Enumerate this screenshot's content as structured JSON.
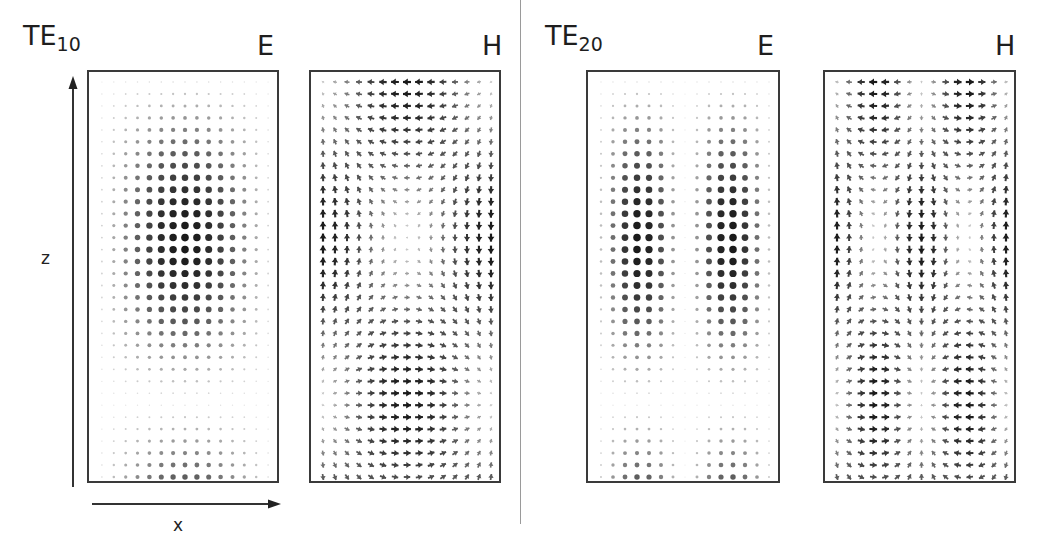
{
  "figure": {
    "modes": [
      {
        "id": "te10",
        "title_main": "TE",
        "title_sub": "10",
        "e_label": "E",
        "h_label": "H",
        "m": 1,
        "cols": 15,
        "rows": 34
      },
      {
        "id": "te20",
        "title_main": "TE",
        "title_sub": "20",
        "e_label": "E",
        "h_label": "H",
        "m": 2,
        "cols": 15,
        "rows": 34
      }
    ],
    "axes": {
      "z_label": "z",
      "x_label": "x"
    },
    "colors": {
      "ink": "#222222",
      "frame": "#3a3a3a",
      "divider": "#9a9a9a"
    }
  }
}
